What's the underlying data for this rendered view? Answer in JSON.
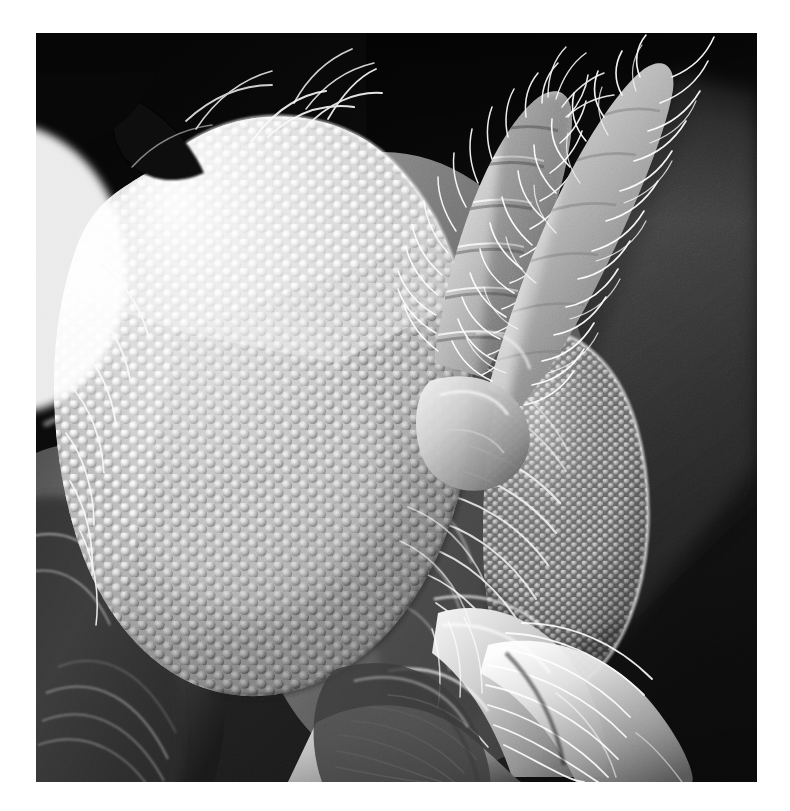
{
  "page": {
    "background_color": "#ffffff",
    "kind": "photograph-on-white-page",
    "caption": ""
  },
  "photo": {
    "title": "Scanning electron micrograph of an insect head",
    "subject": "insect head in profile",
    "technique": "scanning electron microscopy (SEM)",
    "palette": "grayscale",
    "frame": {
      "x": 36,
      "y": 33,
      "width": 721,
      "height": 749
    },
    "background": {
      "top_color": "#060606",
      "mid_color": "#1d1d1d",
      "haze_color": "#6e6e6e",
      "bottom_color": "#141414",
      "description": "dark out-of-focus chamber background with a pale diagonal haze band at upper right"
    },
    "specimen_colors": {
      "highlight": "#ffffff",
      "light": "#e4e4e4",
      "mid": "#b4b4b4",
      "shadow": "#6a6a6a",
      "deep_shadow": "#2e2e2e"
    },
    "features": [
      {
        "id": "near-compound-eye",
        "label": "Near compound eye",
        "description": "large hemispherical compound eye filling the left half of the frame, covered in hexagonally packed dome-shaped ommatidia; facets are blown-out white at the upper left rim and shade to mid grey toward the lower right",
        "facet_count_approx": 560,
        "facet_pattern": "hexagonal close packing",
        "center": {
          "x": 250,
          "y": 400
        },
        "radius": {
          "x": 215,
          "y": 270
        }
      },
      {
        "id": "far-compound-eye",
        "label": "Far compound eye",
        "description": "second, smaller compound eye behind and right of the first, its facets rendered in finer rows and partly veiled by pale curving setae",
        "facet_count_approx": 210,
        "center": {
          "x": 545,
          "y": 470
        },
        "radius": {
          "x": 90,
          "y": 145
        }
      },
      {
        "id": "antenna-left",
        "label": "Plumose antenna (left)",
        "description": "segmented, densely hair-fringed antenna rising diagonally from the head toward the upper left-of-centre; annulated segments visible along its shaft",
        "segments": 7
      },
      {
        "id": "antenna-right",
        "label": "Plumose antenna (right)",
        "description": "second hair-fringed antenna rising toward the upper right corner, brighter and more feathered than its neighbour",
        "segments": 6
      },
      {
        "id": "palps-and-proboscis",
        "label": "Palps and mouthparts",
        "description": "bundle of hairy, jointed mouthpart appendages projecting down and to the right at the lower edge of the frame"
      },
      {
        "id": "thorax",
        "label": "Thorax / body wall",
        "description": "dark, softly lit body surface with broad longitudinal folds occupying the lower left corner"
      },
      {
        "id": "setae",
        "label": "Setae",
        "description": "long, bright, curving bristles scattered over the head, eye margins and appendages",
        "count_approx": 60
      }
    ]
  }
}
